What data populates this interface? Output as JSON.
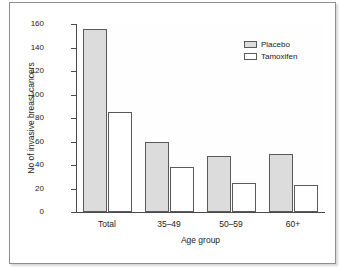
{
  "chart_data": {
    "type": "bar",
    "title": "",
    "subtitle": "",
    "xlabel": "Age group",
    "ylabel": "No of invasive breast cancers",
    "categories": [
      "Total",
      "35–49",
      "50–59",
      "60+"
    ],
    "series": [
      {
        "name": "Placebo",
        "values": [
          156,
          60,
          48,
          49
        ],
        "color": "#dcdcdc"
      },
      {
        "name": "Tamoxifen",
        "values": [
          85,
          38,
          25,
          23
        ],
        "color": "#ffffff"
      }
    ],
    "ylim": [
      0,
      160
    ],
    "yticks": [
      0,
      20,
      40,
      60,
      80,
      100,
      120,
      140,
      160
    ],
    "ytick_labels": [
      "0",
      "20",
      "40",
      "60",
      "80",
      "100",
      "120",
      "140",
      "160"
    ],
    "grid": false,
    "legend_position": "top-right",
    "legend_entries": [
      "Placebo",
      "Tamoxifen"
    ]
  },
  "figure": {
    "border_color": "#8e8e8e",
    "background": "#ffffff",
    "axis_color": "#4a4a4a",
    "bar_edge_color": "#5a5a5a"
  }
}
